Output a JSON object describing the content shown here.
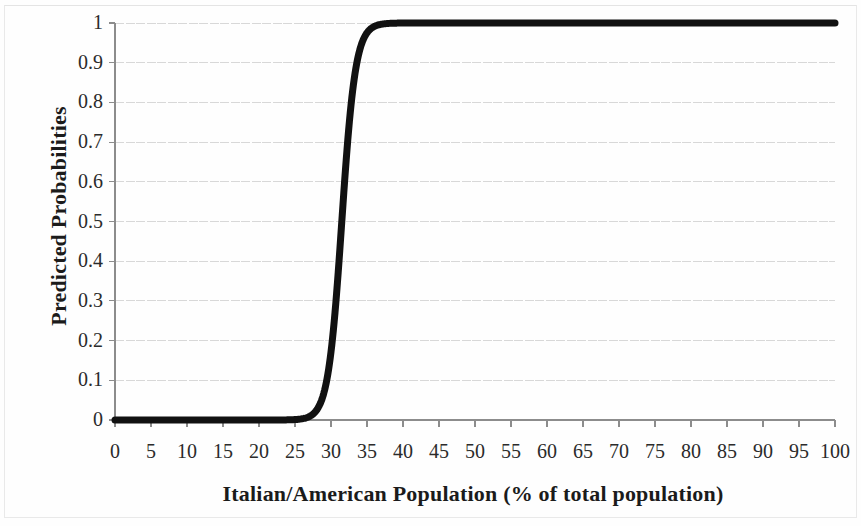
{
  "chart_data": {
    "type": "line",
    "title": "",
    "subtitle": "",
    "xlabel": "Italian/American Population (% of total population)",
    "ylabel": "Predicted Probabilities",
    "xlim": [
      0,
      100
    ],
    "ylim": [
      0,
      1
    ],
    "grid": true,
    "grid_axis": "y",
    "legend": "none",
    "xticks": [
      0,
      5,
      10,
      15,
      20,
      25,
      30,
      35,
      40,
      45,
      50,
      55,
      60,
      65,
      70,
      75,
      80,
      85,
      90,
      95,
      100
    ],
    "xtick_labels": [
      "0",
      "5",
      "10",
      "15",
      "20",
      "25",
      "30",
      "35",
      "40",
      "45",
      "50",
      "55",
      "60",
      "65",
      "70",
      "75",
      "80",
      "85",
      "90",
      "95",
      "100"
    ],
    "yticks": [
      0,
      0.1,
      0.2,
      0.3,
      0.4,
      0.5,
      0.6,
      0.7,
      0.8,
      0.9,
      1
    ],
    "ytick_labels": [
      "0",
      "0.1",
      "0.2",
      "0.3",
      "0.4",
      "0.5",
      "0.6",
      "0.7",
      "0.8",
      "0.9",
      "1"
    ],
    "series": [
      {
        "name": "Predicted probability",
        "kind": "logistic",
        "color": "#111111",
        "line_width": 7,
        "model": {
          "midpoint_x": 31.5,
          "slope": 1.05
        },
        "x": [
          0,
          2,
          4,
          6,
          8,
          10,
          12,
          14,
          16,
          18,
          20,
          21,
          22,
          23,
          24,
          25,
          26,
          27,
          28,
          28.5,
          29,
          29.5,
          30,
          30.5,
          31,
          31.5,
          32,
          32.5,
          33,
          33.5,
          34,
          34.5,
          35,
          36,
          37,
          38,
          40,
          45,
          50,
          60,
          70,
          80,
          90,
          100
        ],
        "y": [
          0.0,
          0.0,
          0.0,
          0.0,
          0.0,
          0.0,
          0.0,
          0.001,
          0.001,
          0.002,
          0.003,
          0.004,
          0.005,
          0.007,
          0.01,
          0.013,
          0.021,
          0.035,
          0.06,
          0.08,
          0.11,
          0.15,
          0.2,
          0.26,
          0.34,
          0.5,
          0.63,
          0.71,
          0.79,
          0.85,
          0.89,
          0.93,
          0.95,
          0.975,
          0.986,
          0.992,
          0.996,
          0.998,
          0.999,
          1.0,
          1.0,
          1.0,
          1.0,
          1.0
        ]
      }
    ]
  },
  "axes": {
    "ytick_labels": [
      "1",
      "0.9",
      "0.8",
      "0.7",
      "0.6",
      "0.5",
      "0.4",
      "0.3",
      "0.2",
      "0.1",
      "0"
    ],
    "xtick_labels": [
      "0",
      "5",
      "10",
      "15",
      "20",
      "25",
      "30",
      "35",
      "40",
      "45",
      "50",
      "55",
      "60",
      "65",
      "70",
      "75",
      "80",
      "85",
      "90",
      "95",
      "100"
    ],
    "xlabel": "Italian/American Population (% of total population)",
    "ylabel": "Predicted Probabilities"
  },
  "colors": {
    "curve": "#111111",
    "gridline": "#d8d8d8",
    "axis": "#8c8c8c",
    "tick_text": "#2b2b2b",
    "label_text": "#1b1b1b",
    "background": "#fefefe",
    "frame": "#e9e9e9"
  }
}
